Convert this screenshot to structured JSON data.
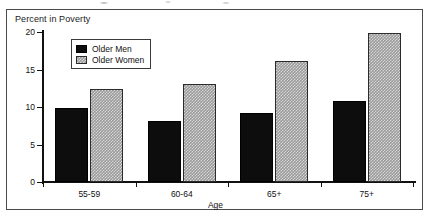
{
  "chart_data": {
    "type": "bar",
    "title": "Percent in Poverty",
    "xlabel": "Age",
    "ylabel": "",
    "categories": [
      "55-59",
      "60-64",
      "65+",
      "75+"
    ],
    "series": [
      {
        "name": "Older Men",
        "values": [
          9.9,
          8.1,
          9.2,
          10.8
        ],
        "color": "#0d0d0d",
        "fill": "solid-black"
      },
      {
        "name": "Older Women",
        "values": [
          12.4,
          13.1,
          16.2,
          19.9
        ],
        "color": "#9a9a9a",
        "fill": "dithered-gray"
      }
    ],
    "ylim": [
      0,
      20
    ],
    "yticks": [
      0,
      5,
      10,
      15,
      20
    ],
    "ytick_labels": [
      "0",
      "5",
      "10",
      "15",
      "20"
    ],
    "grid": false,
    "legend_position": "top-left-inside",
    "frame": true
  },
  "legend": {
    "entries": [
      {
        "label": "Older Men"
      },
      {
        "label": "Older Women"
      }
    ]
  },
  "icons": {
    "swatch_men": "filled-square-icon",
    "swatch_women": "hatched-square-icon"
  }
}
